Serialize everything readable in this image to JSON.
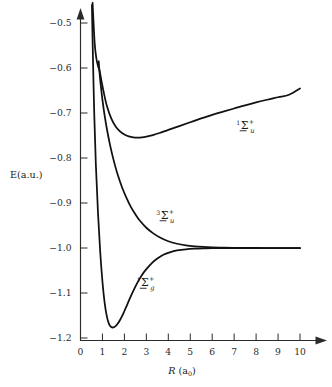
{
  "chart_data": {
    "type": "line",
    "title": "",
    "xlabel": "R (a₀)",
    "ylabel": "E(a.u.)",
    "xlim": [
      0,
      10.5
    ],
    "ylim": [
      -1.2,
      -0.45
    ],
    "grid": false,
    "legend": "inline-labels",
    "xticks": [
      "0",
      "1",
      "2",
      "3",
      "4",
      "5",
      "6",
      "7",
      "8",
      "9",
      "10"
    ],
    "xtick_values": [
      0,
      1,
      2,
      3,
      4,
      5,
      6,
      7,
      8,
      9,
      10
    ],
    "yticks": [
      "-0.5",
      "-0.6",
      "-0.7",
      "-0.8",
      "-0.9",
      "-1.0",
      "-1.1",
      "-1.2"
    ],
    "ytick_values": [
      -0.5,
      -0.6,
      -0.7,
      -0.8,
      -0.9,
      -1.0,
      -1.1,
      -1.2
    ],
    "series": [
      {
        "name": "1Σu+",
        "label_pre": "1",
        "label_sigma": "Σ",
        "label_sub": "u",
        "label_sup": "+",
        "label_x": 7.1,
        "label_y": -0.735,
        "x": [
          0.55,
          0.6,
          0.65,
          0.72,
          0.8,
          0.86,
          0.95,
          1.05,
          1.2,
          1.4,
          1.6,
          1.8,
          2.0,
          2.2,
          2.4,
          2.6,
          2.8,
          3.0,
          3.3,
          3.6,
          4.0,
          4.5,
          5.0,
          5.5,
          6.0,
          6.5,
          7.0,
          7.5,
          8.0,
          8.5,
          9.0,
          9.5,
          10.0
        ],
        "y": [
          -0.455,
          -0.505,
          -0.548,
          -0.578,
          -0.596,
          -0.604,
          -0.627,
          -0.652,
          -0.684,
          -0.712,
          -0.73,
          -0.741,
          -0.748,
          -0.752,
          -0.754,
          -0.7545,
          -0.754,
          -0.7525,
          -0.749,
          -0.7445,
          -0.7375,
          -0.729,
          -0.7205,
          -0.712,
          -0.704,
          -0.697,
          -0.69,
          -0.683,
          -0.6765,
          -0.6705,
          -0.665,
          -0.6595,
          -0.6455
        ]
      },
      {
        "name": "3Σu+",
        "label_pre": "3",
        "label_sigma": "Σ",
        "label_sub": "u",
        "label_sup": "+",
        "label_x": 3.45,
        "label_y": -0.935,
        "x": [
          0.83,
          0.87,
          0.92,
          1.0,
          1.1,
          1.2,
          1.35,
          1.5,
          1.7,
          1.9,
          2.1,
          2.3,
          2.5,
          2.7,
          3.0,
          3.3,
          3.6,
          4.0,
          4.4,
          4.8,
          5.2,
          5.6,
          6.0,
          6.5,
          7.0,
          7.5,
          8.0,
          8.5,
          9.0,
          9.5,
          10.0
        ],
        "y": [
          -0.585,
          -0.612,
          -0.637,
          -0.671,
          -0.706,
          -0.735,
          -0.772,
          -0.803,
          -0.838,
          -0.866,
          -0.889,
          -0.909,
          -0.925,
          -0.939,
          -0.955,
          -0.967,
          -0.976,
          -0.985,
          -0.9905,
          -0.994,
          -0.9962,
          -0.9976,
          -0.9985,
          -0.9992,
          -0.9996,
          -0.9998,
          -0.9999,
          -1.0,
          -1.0,
          -1.0,
          -1.0
        ]
      },
      {
        "name": "1Σg+",
        "label_pre": "1",
        "label_sigma": "Σ",
        "label_sub": "g",
        "label_sup": "+",
        "label_x": 2.55,
        "label_y": -1.085,
        "x": [
          0.52,
          0.56,
          0.62,
          0.7,
          0.8,
          0.9,
          1.0,
          1.1,
          1.2,
          1.3,
          1.4,
          1.5,
          1.6,
          1.7,
          1.8,
          1.9,
          2.0,
          2.1,
          2.25,
          2.4,
          2.6,
          2.8,
          3.0,
          3.25,
          3.5,
          3.8,
          4.1,
          4.4,
          4.8,
          5.2,
          5.6,
          6.0,
          6.5,
          7.0,
          7.5,
          8.0,
          8.5,
          9.0,
          9.5,
          10.0
        ],
        "y": [
          -0.46,
          -0.56,
          -0.69,
          -0.815,
          -0.925,
          -1.01,
          -1.075,
          -1.122,
          -1.152,
          -1.169,
          -1.1755,
          -1.1765,
          -1.1735,
          -1.168,
          -1.16,
          -1.151,
          -1.14,
          -1.129,
          -1.112,
          -1.096,
          -1.0765,
          -1.06,
          -1.047,
          -1.0335,
          -1.0235,
          -1.0145,
          -1.009,
          -1.0055,
          -1.0028,
          -1.0014,
          -1.0007,
          -1.0004,
          -1.0002,
          -1.0001,
          -1.0,
          -1.0,
          -1.0,
          -1.0,
          -1.0,
          -1.0
        ]
      }
    ]
  },
  "axes": {
    "y_axis_title": "E(a.u.)",
    "x_axis_title_main": "R",
    "x_axis_title_paren_open": "(a",
    "x_axis_title_sub": "0",
    "x_axis_title_paren_close": ")"
  }
}
